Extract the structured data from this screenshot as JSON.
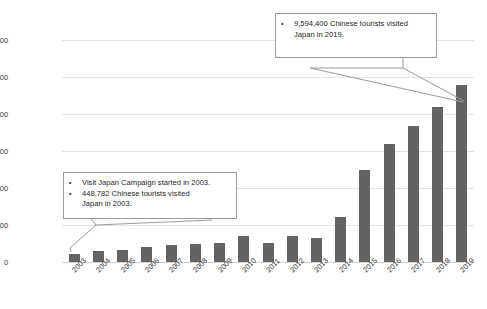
{
  "chart_data": {
    "type": "bar",
    "title": "",
    "xlabel": "",
    "ylabel": "",
    "grid": true,
    "legend": false,
    "ylim": [
      0,
      12000000
    ],
    "yticks": [
      0,
      2000000,
      4000000,
      6000000,
      8000000,
      10000000,
      12000000
    ],
    "ytick_labels": [
      "0",
      "2000000",
      "4000000",
      "6000000",
      "8000000",
      "10000000",
      "12000000"
    ],
    "categories": [
      "2003",
      "2004",
      "2005",
      "2006",
      "2007",
      "2008",
      "2009",
      "2010",
      "2011",
      "2012",
      "2013",
      "2014",
      "2015",
      "2016",
      "2017",
      "2018",
      "2019"
    ],
    "values": [
      448782,
      616009,
      652820,
      811675,
      942439,
      1000416,
      1006085,
      1412875,
      1043246,
      1425100,
      1314437,
      2409158,
      4993689,
      6373564,
      7355818,
      8380034,
      9594400
    ],
    "series": [
      {
        "name": "Chinese tourists visiting Japan",
        "color": "#636363",
        "values": [
          448782,
          616009,
          652820,
          811675,
          942439,
          1000416,
          1006085,
          1412875,
          1043246,
          1425100,
          1314437,
          2409158,
          4993689,
          6373564,
          7355818,
          8380034,
          9594400
        ]
      }
    ],
    "annotations": [
      {
        "id": "callout-2003",
        "target_category": "2003",
        "lines": [
          "Visit Japan Campaign started in 2003.",
          "448,782 Chinese tourists visited Japan in 2003."
        ]
      },
      {
        "id": "callout-2019",
        "target_category": "2019",
        "lines": [
          "9,594,400 Chinese tourists visited Japan in 2019."
        ]
      }
    ]
  },
  "callouts": {
    "left": {
      "line1": "Visit Japan Campaign started in 2003.",
      "line2a": "448,782 Chinese tourists visited",
      "line2b": "Japan in 2003.",
      "bullet": "•"
    },
    "right": {
      "line1a": "9,594,400 Chinese tourists visited",
      "line1b": "Japan in 2019.",
      "bullet": "•"
    }
  },
  "colors": {
    "bar": "#636363",
    "grid": "#e3e3e3",
    "axis": "#d2d2d2",
    "text": "#3b3b3b",
    "callout_border": "#9a9a9a",
    "background": "#ffffff"
  }
}
